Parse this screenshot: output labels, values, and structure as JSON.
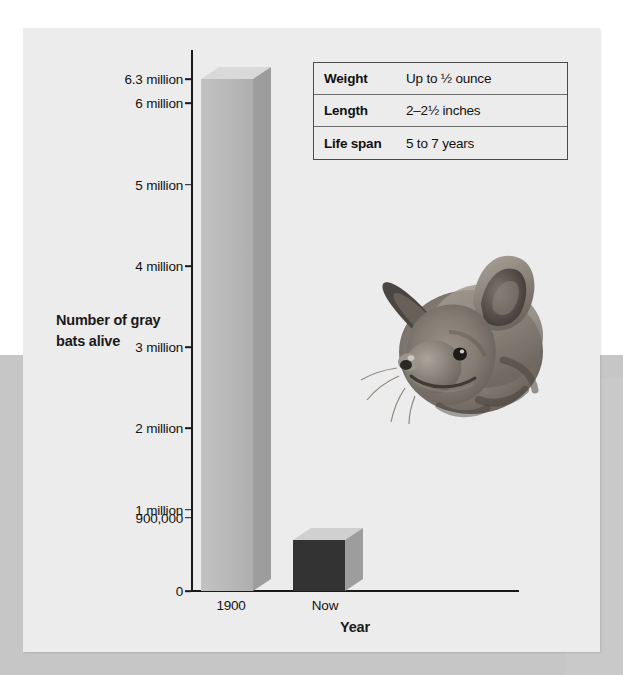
{
  "figure": {
    "panel_bg": "#ececec",
    "backdrop_white": "#ffffff",
    "backdrop_gray": "#c6c6c6"
  },
  "chart_data": {
    "type": "bar",
    "title": "",
    "xlabel": "Year",
    "ylabel": "Number of gray bats alive",
    "categories": [
      "1900",
      "Now"
    ],
    "values": [
      6300000,
      900000
    ],
    "value_labels": [
      "6.3 million",
      "900,000"
    ],
    "ylim": [
      0,
      6600000
    ],
    "grid": false,
    "legend": "none",
    "bar_colors": [
      "#b8b8b8",
      "#333333"
    ],
    "ytick_values": [
      6300000,
      6000000,
      5000000,
      4000000,
      3000000,
      2000000,
      1000000,
      900000,
      0
    ],
    "ytick_labels": [
      "6.3 million",
      "6 million",
      "5 million",
      "4 million",
      "3 million",
      "2 million",
      "1 million",
      "900,000",
      "0"
    ]
  },
  "fact_table": {
    "rows": [
      {
        "key": "Weight",
        "value": "Up to ½ ounce"
      },
      {
        "key": "Length",
        "value": "2–2½ inches"
      },
      {
        "key": "Life span",
        "value": "5 to 7 years"
      }
    ]
  },
  "illustration": {
    "name": "gray-bat-head",
    "alt": "Illustration of a gray bat head in profile"
  }
}
